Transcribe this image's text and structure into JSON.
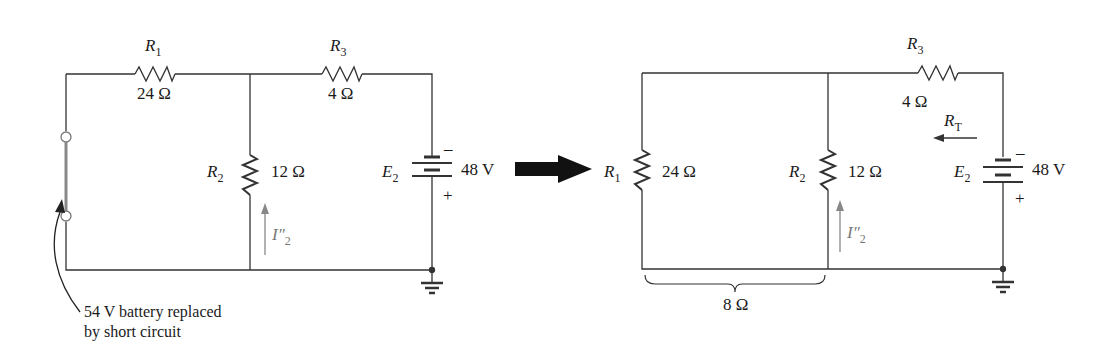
{
  "left_circuit": {
    "r1": {
      "name": "R",
      "sub": "1",
      "value": "24 Ω"
    },
    "r2": {
      "name": "R",
      "sub": "2",
      "value": "12 Ω"
    },
    "r3": {
      "name": "R",
      "sub": "3",
      "value": "4 Ω"
    },
    "e2": {
      "name": "E",
      "sub": "2",
      "value": "48 V",
      "minus": "–",
      "plus": "+"
    },
    "current": {
      "name": "I″",
      "sub": "2"
    },
    "annotation": {
      "line1": "54 V battery replaced",
      "line2": "by short circuit"
    }
  },
  "right_circuit": {
    "r1": {
      "name": "R",
      "sub": "1",
      "value": "24 Ω"
    },
    "r2": {
      "name": "R",
      "sub": "2",
      "value": "12 Ω"
    },
    "r3": {
      "name": "R",
      "sub": "3",
      "value": "4 Ω"
    },
    "e2": {
      "name": "E",
      "sub": "2",
      "value": "48 V",
      "minus": "–",
      "plus": "+"
    },
    "current": {
      "name": "I″",
      "sub": "2"
    },
    "rt": {
      "name": "R",
      "sub": "T"
    },
    "parallel_equiv": "8 Ω"
  },
  "colors": {
    "wire": "#333333",
    "arrow": "#111111",
    "current_arrow": "#888888"
  }
}
